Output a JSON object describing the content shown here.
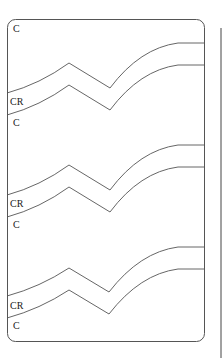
{
  "diagram": {
    "frame": {
      "stroke": "#555555"
    },
    "bands": [
      {
        "top_label": "C",
        "mid_label": "CR",
        "bottom_label": "C"
      },
      {
        "mid_label": "CR",
        "bottom_label": "C"
      },
      {
        "mid_label": "CR",
        "bottom_label": "C"
      }
    ]
  }
}
